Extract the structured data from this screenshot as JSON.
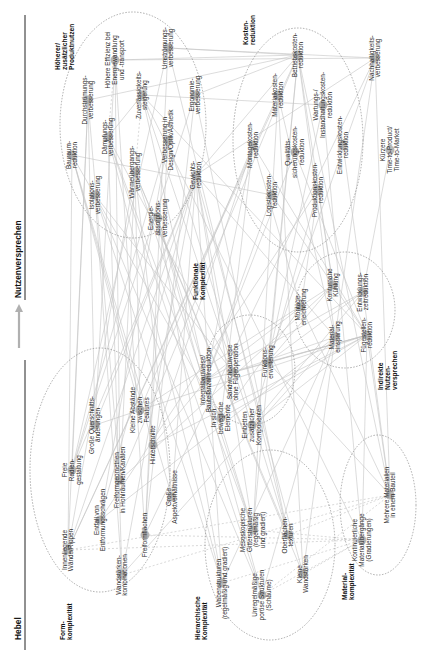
{
  "header": {
    "left_title": "Hebel",
    "right_title": "Nutzenversprechen",
    "arrow_color": "#b0b0b0"
  },
  "clusters": [
    {
      "id": "produktnutzen",
      "label": [
        "Höherer/",
        "zusätzlicher",
        "Produktnutzen"
      ],
      "cx": 133,
      "cy": 125,
      "rx": 73,
      "ry": 113,
      "label_x": 60,
      "label_y": 70
    },
    {
      "id": "kosten",
      "label": [
        "Kosten-",
        "reduktion"
      ],
      "cx": 298,
      "cy": 140,
      "rx": 65,
      "ry": 112,
      "label_x": 248,
      "label_y": 45
    },
    {
      "id": "indirekt",
      "label": [
        "Indirekte",
        "Nutzen-",
        "versprechen"
      ],
      "cx": 345,
      "cy": 310,
      "rx": 50,
      "ry": 58,
      "label_x": 383,
      "label_y": 390
    },
    {
      "id": "funktional",
      "label": [
        "Funktionale",
        "Komplexität"
      ],
      "cx": 250,
      "cy": 370,
      "rx": 45,
      "ry": 55,
      "label_x": 198,
      "label_y": 300
    },
    {
      "id": "form",
      "label": [
        "Form-",
        "komplexität"
      ],
      "cx": 100,
      "cy": 470,
      "rx": 70,
      "ry": 122,
      "label_x": 65,
      "label_y": 640
    },
    {
      "id": "hierarchisch",
      "label": [
        "Hierarchische",
        "Komplexität"
      ],
      "cx": 270,
      "cy": 545,
      "rx": 65,
      "ry": 95,
      "label_x": 200,
      "label_y": 640
    },
    {
      "id": "material",
      "label": [
        "Material-",
        "komplexität"
      ],
      "cx": 378,
      "cy": 505,
      "rx": 38,
      "ry": 70,
      "label_x": 347,
      "label_y": 600
    }
  ],
  "nodes": [
    {
      "id": "bauraum",
      "label": [
        "Bauraum-",
        "reduktion"
      ],
      "x": 72,
      "y": 155,
      "cluster": "produktnutzen"
    },
    {
      "id": "durchstroemung",
      "label": [
        "Durchströmungs-",
        "verbesserung"
      ],
      "x": 88,
      "y": 100,
      "cluster": "produktnutzen"
    },
    {
      "id": "daempfung",
      "label": [
        "Dämpfungs-",
        "verbesserung"
      ],
      "x": 108,
      "y": 137,
      "cluster": "produktnutzen"
    },
    {
      "id": "effizienz",
      "label": [
        "Höhere Effizienz bei",
        "Energiewandlung",
        "und -transport"
      ],
      "x": 115,
      "y": 60,
      "cluster": "produktnutzen"
    },
    {
      "id": "zuverlaessigkeit",
      "label": [
        "Zuverlässigkeits-",
        "steigerung"
      ],
      "x": 142,
      "y": 95,
      "cluster": "produktnutzen"
    },
    {
      "id": "umstroemung",
      "label": [
        "Umströmungs-",
        "verbesserung"
      ],
      "x": 168,
      "y": 48,
      "cluster": "produktnutzen"
    },
    {
      "id": "ergonomie",
      "label": [
        "Ergonomie-",
        "verbesserung"
      ],
      "x": 195,
      "y": 95,
      "cluster": "produktnutzen"
    },
    {
      "id": "design",
      "label": [
        "Verbesserung in",
        "Design/Optik/Ästhetik"
      ],
      "x": 168,
      "y": 140,
      "cluster": "produktnutzen"
    },
    {
      "id": "waermeuebergang",
      "label": [
        "Wärmeübergangs-",
        "verbesserung"
      ],
      "x": 135,
      "y": 172,
      "cluster": "produktnutzen"
    },
    {
      "id": "isolation",
      "label": [
        "Isolations-",
        "verbesserung"
      ],
      "x": 95,
      "y": 195,
      "cluster": "produktnutzen"
    },
    {
      "id": "gewicht",
      "label": [
        "Gewichts-",
        "reduktion"
      ],
      "x": 196,
      "y": 175,
      "cluster": "produktnutzen"
    },
    {
      "id": "energieabsorption",
      "label": [
        "Energie-",
        "absorptions-",
        "verbesserung"
      ],
      "x": 158,
      "y": 218,
      "cluster": "produktnutzen"
    },
    {
      "id": "betriebskosten",
      "label": [
        "Betriebskosten-",
        "reduktion"
      ],
      "x": 298,
      "y": 55,
      "cluster": "kosten"
    },
    {
      "id": "materialkosten",
      "label": [
        "Materialkosten-",
        "reduktion"
      ],
      "x": 278,
      "y": 95,
      "cluster": "kosten"
    },
    {
      "id": "wartung",
      "label": [
        "Wartungs-/",
        "Instandhaltungskosten-",
        "reduktion"
      ],
      "x": 323,
      "y": 105,
      "cluster": "kosten"
    },
    {
      "id": "montagekosten",
      "label": [
        "Montagekosten-",
        "reduktion"
      ],
      "x": 253,
      "y": 145,
      "cluster": "kosten"
    },
    {
      "id": "qualitaet",
      "label": [
        "Qualitäts-",
        "sicherungskosten-",
        "reduktion"
      ],
      "x": 295,
      "y": 152,
      "cluster": "kosten"
    },
    {
      "id": "entwicklungskosten",
      "label": [
        "Entwicklungskosten-",
        "reduktion"
      ],
      "x": 343,
      "y": 145,
      "cluster": "kosten"
    },
    {
      "id": "logistik",
      "label": [
        "Logistikkosten-",
        "reduktion"
      ],
      "x": 272,
      "y": 195,
      "cluster": "kosten"
    },
    {
      "id": "produktion",
      "label": [
        "Produktionskosten-",
        "reduktion"
      ],
      "x": 318,
      "y": 190,
      "cluster": "kosten"
    },
    {
      "id": "nachhaltigkeit",
      "label": [
        "Nachhaltigkeits-",
        "verbesserung"
      ],
      "x": 375,
      "y": 58,
      "cluster": null
    },
    {
      "id": "ttm",
      "label": [
        "Kürzere",
        "Time-to-Product/",
        "Time-to-Market"
      ],
      "x": 390,
      "y": 150,
      "cluster": null
    },
    {
      "id": "montageerleichterung",
      "label": [
        "Montage-",
        "erleichterung"
      ],
      "x": 301,
      "y": 307,
      "cluster": "indirekt"
    },
    {
      "id": "kuehlung",
      "label": [
        "Konturnahe",
        "Kühlung"
      ],
      "x": 333,
      "y": 285,
      "cluster": "indirekt"
    },
    {
      "id": "entwicklungszeit",
      "label": [
        "Entwicklungs-",
        "zeitreduktion"
      ],
      "x": 363,
      "y": 292,
      "cluster": "indirekt"
    },
    {
      "id": "materialeinsparung",
      "label": [
        "Material-",
        "einsparung"
      ],
      "x": 335,
      "y": 337,
      "cluster": "indirekt"
    },
    {
      "id": "fuegestellen",
      "label": [
        "Fügestellen-",
        "reduktion"
      ],
      "x": 367,
      "y": 335,
      "cluster": "indirekt"
    },
    {
      "id": "integral",
      "label": [
        "Integralbauweise/",
        "Bauteilanzahlreduktion"
      ],
      "x": 206,
      "y": 380,
      "cluster": "funktional"
    },
    {
      "id": "sandwich",
      "label": [
        "Sandwichbauweise",
        "ohne Fügeoperation"
      ],
      "x": 233,
      "y": 372,
      "cluster": "funktional"
    },
    {
      "id": "funktionserweiterung",
      "label": [
        "Funktions-",
        "erweiterung"
      ],
      "x": 268,
      "y": 362,
      "cluster": "funktional"
    },
    {
      "id": "beweglich",
      "label": [
        "In sich",
        "bewegliche",
        "Elemente"
      ],
      "x": 221,
      "y": 418,
      "cluster": "funktional"
    },
    {
      "id": "einbetten",
      "label": [
        "Einbetten",
        "zusätzlicher",
        "Komponenten"
      ],
      "x": 252,
      "y": 425,
      "cluster": "funktional"
    },
    {
      "id": "wandrippen",
      "label": [
        "Innenliegende",
        "Wände/Rippen"
      ],
      "x": 68,
      "y": 550,
      "cluster": "form"
    },
    {
      "id": "radien",
      "label": [
        "Freie",
        "Radien-",
        "gestaltung"
      ],
      "x": 72,
      "y": 470,
      "cluster": "form"
    },
    {
      "id": "querschnitt",
      "label": [
        "Große Querschnitts-",
        "änderungen"
      ],
      "x": 95,
      "y": 425,
      "cluster": "form"
    },
    {
      "id": "abstaende",
      "label": [
        "Kleine Abstände",
        "zwischen",
        "Features"
      ],
      "x": 140,
      "y": 410,
      "cluster": "form"
    },
    {
      "id": "entfall",
      "label": [
        "Entfall von",
        "Entformungsschrägen"
      ],
      "x": 100,
      "y": 520,
      "cluster": "form"
    },
    {
      "id": "freiformhohl",
      "label": [
        "Freiformgeometrien",
        "in Hohlräumen/Kanälen"
      ],
      "x": 120,
      "y": 480,
      "cluster": "form"
    },
    {
      "id": "hinterschnitte",
      "label": [
        "Hinterschnitte"
      ],
      "x": 153,
      "y": 445,
      "cluster": "form"
    },
    {
      "id": "wandstaerken",
      "label": [
        "Wandstärken-",
        "kombinationen"
      ],
      "x": 122,
      "y": 575,
      "cluster": "form"
    },
    {
      "id": "freiformflaechen",
      "label": [
        "Freiformflächen"
      ],
      "x": 145,
      "y": 535,
      "cluster": "form"
    },
    {
      "id": "aspekt",
      "label": [
        "Große",
        "Aspektverhältnisse"
      ],
      "x": 172,
      "y": 497,
      "cluster": "form"
    },
    {
      "id": "waben",
      "label": [
        "Wabenstrukturen",
        "(regelmäßig und gradiert)"
      ],
      "x": 222,
      "y": 583,
      "cluster": "hierarchisch"
    },
    {
      "id": "gitter",
      "label": [
        "Mesoskopische",
        "Gitterstrukturen",
        "(regelmäßig",
        "und gradiert)"
      ],
      "x": 253,
      "y": 530,
      "cluster": "hierarchisch"
    },
    {
      "id": "poroes",
      "label": [
        "Unregelmäßige",
        "poröse Strukturen",
        "(Schäume)"
      ],
      "x": 262,
      "y": 595,
      "cluster": "hierarchisch"
    },
    {
      "id": "oberflaeche",
      "label": [
        "Oberflächen-",
        "texturen"
      ],
      "x": 288,
      "y": 535,
      "cluster": "hierarchisch"
    },
    {
      "id": "kleinewand",
      "label": [
        "Kleine",
        "Wandstärken"
      ],
      "x": 303,
      "y": 574,
      "cluster": "hierarchisch"
    },
    {
      "id": "kontinuierlich",
      "label": [
        "Kontinuierliche",
        "Materialübergänge",
        "(Gradierungen)"
      ],
      "x": 362,
      "y": 540,
      "cluster": "material"
    },
    {
      "id": "mehrere",
      "label": [
        "Mehrere Materialien",
        "in einem Bauteil"
      ],
      "x": 390,
      "y": 495,
      "cluster": "material"
    }
  ],
  "edges": [
    [
      "wandrippen",
      "bauraum"
    ],
    [
      "wandrippen",
      "gewicht"
    ],
    [
      "wandrippen",
      "waermeuebergang"
    ],
    [
      "wandrippen",
      "durchstroemung"
    ],
    [
      "wandrippen",
      "materialkosten"
    ],
    [
      "wandrippen",
      "betriebskosten"
    ],
    [
      "radien",
      "durchstroemung"
    ],
    [
      "radien",
      "umstroemung"
    ],
    [
      "radien",
      "design"
    ],
    [
      "radien",
      "ergonomie"
    ],
    [
      "radien",
      "gewicht"
    ],
    [
      "querschnitt",
      "durchstroemung"
    ],
    [
      "querschnitt",
      "effizienz"
    ],
    [
      "querschnitt",
      "gewicht"
    ],
    [
      "querschnitt",
      "fuegestellen"
    ],
    [
      "abstaende",
      "bauraum"
    ],
    [
      "abstaende",
      "waermeuebergang"
    ],
    [
      "abstaende",
      "kuehlung"
    ],
    [
      "abstaende",
      "montagekosten"
    ],
    [
      "entfall",
      "gewicht"
    ],
    [
      "entfall",
      "materialeinsparung"
    ],
    [
      "entfall",
      "design"
    ],
    [
      "entfall",
      "produktion"
    ],
    [
      "freiformhohl",
      "durchstroemung"
    ],
    [
      "freiformhohl",
      "effizienz"
    ],
    [
      "freiformhohl",
      "kuehlung"
    ],
    [
      "freiformhohl",
      "waermeuebergang"
    ],
    [
      "freiformhohl",
      "betriebskosten"
    ],
    [
      "hinterschnitte",
      "bauraum"
    ],
    [
      "hinterschnitte",
      "fuegestellen"
    ],
    [
      "hinterschnitte",
      "integral"
    ],
    [
      "hinterschnitte",
      "montagekosten"
    ],
    [
      "wandstaerken",
      "gewicht"
    ],
    [
      "wandstaerken",
      "daempfung"
    ],
    [
      "wandstaerken",
      "isolation"
    ],
    [
      "wandstaerken",
      "materialeinsparung"
    ],
    [
      "freiformflaechen",
      "umstroemung"
    ],
    [
      "freiformflaechen",
      "design"
    ],
    [
      "freiformflaechen",
      "ergonomie"
    ],
    [
      "freiformflaechen",
      "effizienz"
    ],
    [
      "freiformflaechen",
      "nachhaltigkeit"
    ],
    [
      "aspekt",
      "waermeuebergang"
    ],
    [
      "aspekt",
      "bauraum"
    ],
    [
      "aspekt",
      "gewicht"
    ],
    [
      "integral",
      "montageerleichterung"
    ],
    [
      "integral",
      "fuegestellen"
    ],
    [
      "integral",
      "montagekosten"
    ],
    [
      "integral",
      "logistik"
    ],
    [
      "integral",
      "qualitaet"
    ],
    [
      "integral",
      "zuverlaessigkeit"
    ],
    [
      "integral",
      "entwicklungszeit"
    ],
    [
      "sandwich",
      "fuegestellen"
    ],
    [
      "sandwich",
      "gewicht"
    ],
    [
      "sandwich",
      "isolation"
    ],
    [
      "sandwich",
      "daempfung"
    ],
    [
      "sandwich",
      "materialeinsparung"
    ],
    [
      "funktionserweiterung",
      "entwicklungszeit"
    ],
    [
      "funktionserweiterung",
      "fuegestellen"
    ],
    [
      "funktionserweiterung",
      "kuehlung"
    ],
    [
      "funktionserweiterung",
      "betriebskosten"
    ],
    [
      "funktionserweiterung",
      "wartung"
    ],
    [
      "funktionserweiterung",
      "nachhaltigkeit"
    ],
    [
      "beweglich",
      "montageerleichterung"
    ],
    [
      "beweglich",
      "montagekosten"
    ],
    [
      "beweglich",
      "fuegestellen"
    ],
    [
      "beweglich",
      "bauraum"
    ],
    [
      "einbetten",
      "fuegestellen"
    ],
    [
      "einbetten",
      "entwicklungszeit"
    ],
    [
      "einbetten",
      "zuverlaessigkeit"
    ],
    [
      "einbetten",
      "produktion"
    ],
    [
      "waben",
      "gewicht"
    ],
    [
      "waben",
      "energieabsorption"
    ],
    [
      "waben",
      "isolation"
    ],
    [
      "waben",
      "daempfung"
    ],
    [
      "waben",
      "materialeinsparung"
    ],
    [
      "gitter",
      "gewicht"
    ],
    [
      "gitter",
      "energieabsorption"
    ],
    [
      "gitter",
      "waermeuebergang"
    ],
    [
      "gitter",
      "daempfung"
    ],
    [
      "gitter",
      "materialkosten"
    ],
    [
      "gitter",
      "betriebskosten"
    ],
    [
      "poroes",
      "isolation"
    ],
    [
      "poroes",
      "daempfung"
    ],
    [
      "poroes",
      "energieabsorption"
    ],
    [
      "poroes",
      "materialeinsparung"
    ],
    [
      "oberflaeche",
      "design"
    ],
    [
      "oberflaeche",
      "ergonomie"
    ],
    [
      "oberflaeche",
      "umstroemung"
    ],
    [
      "oberflaeche",
      "waermeuebergang"
    ],
    [
      "kleinewand",
      "gewicht"
    ],
    [
      "kleinewand",
      "materialeinsparung"
    ],
    [
      "kleinewand",
      "waermeuebergang"
    ],
    [
      "kleinewand",
      "materialkosten"
    ],
    [
      "kontinuierlich",
      "zuverlaessigkeit"
    ],
    [
      "kontinuierlich",
      "fuegestellen"
    ],
    [
      "kontinuierlich",
      "wartung"
    ],
    [
      "mehrere",
      "fuegestellen"
    ],
    [
      "mehrere",
      "montageerleichterung"
    ],
    [
      "mehrere",
      "entwicklungszeit"
    ],
    [
      "mehrere",
      "funktionserweiterung"
    ],
    [
      "mehrere",
      "betriebskosten"
    ],
    [
      "mehrere",
      "nachhaltigkeit"
    ],
    [
      "materialeinsparung",
      "materialkosten"
    ],
    [
      "materialeinsparung",
      "nachhaltigkeit"
    ],
    [
      "materialeinsparung",
      "gewicht"
    ],
    [
      "materialeinsparung",
      "betriebskosten"
    ],
    [
      "fuegestellen",
      "montagekosten"
    ],
    [
      "fuegestellen",
      "qualitaet"
    ],
    [
      "fuegestellen",
      "logistik"
    ],
    [
      "fuegestellen",
      "zuverlaessigkeit"
    ],
    [
      "entwicklungszeit",
      "entwicklungskosten"
    ],
    [
      "entwicklungszeit",
      "ttm"
    ],
    [
      "montageerleichterung",
      "montagekosten"
    ],
    [
      "montageerleichterung",
      "produktion"
    ],
    [
      "kuehlung",
      "produktion"
    ],
    [
      "kuehlung",
      "betriebskosten"
    ],
    [
      "gewicht",
      "betriebskosten"
    ],
    [
      "gewicht",
      "nachhaltigkeit"
    ],
    [
      "effizienz",
      "betriebskosten"
    ],
    [
      "effizienz",
      "nachhaltigkeit"
    ],
    [
      "umstroemung",
      "betriebskosten"
    ],
    [
      "durchstroemung",
      "betriebskosten"
    ],
    [
      "zuverlaessigkeit",
      "wartung"
    ],
    [
      "bauraum",
      "logistik"
    ],
    [
      "ergonomie",
      "betriebskosten"
    ],
    [
      "umstroemung",
      "nachhaltigkeit"
    ],
    [
      "daempfung",
      "zuverlaessigkeit"
    ]
  ],
  "dashed_edges": [
    [
      "wandrippen",
      "mehrere"
    ],
    [
      "wandstaerken",
      "mehrere"
    ],
    [
      "wandrippen",
      "kontinuierlich"
    ],
    [
      "freiformflaechen",
      "kontinuierlich"
    ],
    [
      "waben",
      "kontinuierlich"
    ],
    [
      "poroes",
      "mehrere"
    ],
    [
      "oberflaeche",
      "mehrere"
    ],
    [
      "gitter",
      "kontinuierlich"
    ],
    [
      "daempfung",
      "effizienz"
    ],
    [
      "zuverlaessigkeit",
      "waermeuebergang"
    ],
    [
      "kleinewand",
      "kontinuierlich"
    ],
    [
      "poroes",
      "kontinuierlich"
    ]
  ]
}
